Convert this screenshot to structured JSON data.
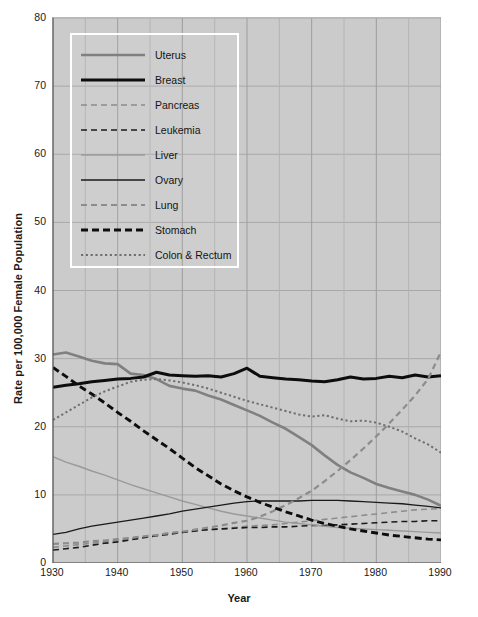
{
  "chart_data": {
    "type": "line",
    "title": "",
    "xlabel": "Year",
    "ylabel": "Rate per 100,000 Female Population",
    "xlim": [
      1930,
      1990
    ],
    "ylim": [
      0,
      80
    ],
    "ytick_labels": [
      "0",
      "10",
      "20",
      "30",
      "40",
      "50",
      "60",
      "70",
      "80"
    ],
    "ytick_values": [
      0,
      10,
      20,
      30,
      40,
      50,
      60,
      70,
      80
    ],
    "xtick_labels": [
      "1930",
      "1940",
      "1950",
      "1960",
      "1970",
      "1980",
      "1990"
    ],
    "xtick_values": [
      1930,
      1940,
      1950,
      1960,
      1970,
      1980,
      1990
    ],
    "xminor_values": [
      1935,
      1945,
      1955,
      1965,
      1975,
      1985
    ],
    "grid": true,
    "legend_position": "upper-left",
    "x": [
      1930,
      1932,
      1934,
      1936,
      1938,
      1940,
      1942,
      1944,
      1946,
      1948,
      1950,
      1952,
      1954,
      1956,
      1958,
      1960,
      1962,
      1964,
      1966,
      1968,
      1970,
      1972,
      1974,
      1976,
      1978,
      1980,
      1982,
      1984,
      1986,
      1988,
      1990
    ],
    "series": [
      {
        "name": "Uterus",
        "style": "solid",
        "color": "#808080",
        "width": 2.6,
        "values": [
          30.6,
          30.9,
          30.3,
          29.7,
          29.3,
          29.2,
          27.8,
          27.6,
          27.0,
          26.0,
          25.6,
          25.3,
          24.6,
          24.0,
          23.2,
          22.4,
          21.6,
          20.6,
          19.7,
          18.5,
          17.3,
          15.8,
          14.4,
          13.3,
          12.5,
          11.6,
          11.0,
          10.5,
          10.0,
          9.3,
          8.4
        ]
      },
      {
        "name": "Breast",
        "style": "solid",
        "color": "#0d0d0d",
        "width": 3.0,
        "values": [
          25.8,
          26.1,
          26.3,
          26.6,
          26.8,
          27.0,
          27.1,
          27.3,
          28.0,
          27.6,
          27.5,
          27.4,
          27.5,
          27.3,
          27.8,
          28.6,
          27.4,
          27.2,
          27.0,
          26.9,
          26.7,
          26.6,
          26.9,
          27.3,
          27.0,
          27.1,
          27.4,
          27.2,
          27.6,
          27.3,
          27.5
        ]
      },
      {
        "name": "Pancreas",
        "style": "dashed-light",
        "color": "#8c8c8c",
        "width": 1.6,
        "values": [
          2.3,
          2.5,
          2.7,
          2.9,
          3.1,
          3.3,
          3.6,
          3.8,
          4.1,
          4.3,
          4.5,
          4.7,
          4.9,
          5.0,
          5.2,
          5.4,
          5.5,
          5.6,
          5.8,
          6.0,
          6.2,
          6.4,
          6.6,
          6.8,
          7.0,
          7.2,
          7.4,
          7.6,
          7.8,
          7.9,
          8.0
        ]
      },
      {
        "name": "Leukemia",
        "style": "dashed-dark",
        "color": "#1a1a1a",
        "width": 1.6,
        "values": [
          1.9,
          2.1,
          2.3,
          2.6,
          2.9,
          3.1,
          3.4,
          3.7,
          4.0,
          4.2,
          4.5,
          4.7,
          4.9,
          5.0,
          5.1,
          5.2,
          5.2,
          5.3,
          5.3,
          5.4,
          5.5,
          5.5,
          5.6,
          5.7,
          5.8,
          5.9,
          6.0,
          6.1,
          6.1,
          6.2,
          6.2
        ]
      },
      {
        "name": "Liver",
        "style": "solid",
        "color": "#9a9a9a",
        "width": 1.4,
        "values": [
          15.6,
          14.8,
          14.2,
          13.5,
          12.9,
          12.2,
          11.5,
          10.9,
          10.3,
          9.7,
          9.1,
          8.6,
          8.1,
          7.6,
          7.2,
          6.9,
          6.6,
          6.3,
          6.0,
          5.8,
          5.6,
          5.4,
          5.2,
          5.1,
          5.0,
          4.9,
          4.8,
          4.7,
          4.6,
          4.5,
          4.4
        ]
      },
      {
        "name": "Ovary",
        "style": "solid",
        "color": "#1a1a1a",
        "width": 1.3,
        "values": [
          4.2,
          4.5,
          5.0,
          5.4,
          5.7,
          6.0,
          6.3,
          6.6,
          6.9,
          7.2,
          7.6,
          7.9,
          8.2,
          8.5,
          8.8,
          9.0,
          9.1,
          9.1,
          9.1,
          9.1,
          9.2,
          9.2,
          9.2,
          9.1,
          9.0,
          8.9,
          8.8,
          8.7,
          8.5,
          8.3,
          8.1
        ]
      },
      {
        "name": "Lung",
        "style": "dashed-light",
        "color": "#8c8c8c",
        "width": 2.2,
        "values": [
          2.8,
          2.9,
          3.0,
          3.2,
          3.3,
          3.5,
          3.7,
          3.9,
          4.1,
          4.4,
          4.6,
          4.9,
          5.2,
          5.5,
          5.9,
          6.2,
          6.8,
          7.6,
          8.5,
          9.5,
          10.6,
          12.0,
          13.5,
          15.1,
          16.8,
          18.6,
          20.5,
          22.5,
          24.6,
          27.0,
          31.0
        ]
      },
      {
        "name": "Stomach",
        "style": "dashed-bold",
        "color": "#0d0d0d",
        "width": 2.9,
        "values": [
          28.7,
          27.4,
          26.0,
          24.8,
          23.5,
          22.1,
          20.8,
          19.4,
          18.1,
          16.8,
          15.4,
          14.0,
          12.8,
          11.6,
          10.6,
          9.7,
          8.9,
          8.2,
          7.5,
          6.9,
          6.3,
          5.8,
          5.4,
          5.0,
          4.7,
          4.4,
          4.1,
          3.9,
          3.7,
          3.5,
          3.4
        ]
      },
      {
        "name": "Colon & Rectum",
        "style": "dotted",
        "color": "#6f6f6f",
        "width": 2.0,
        "values": [
          21.0,
          22.1,
          23.2,
          24.3,
          25.2,
          25.9,
          26.6,
          26.9,
          27.0,
          26.8,
          26.5,
          26.1,
          25.6,
          25.0,
          24.4,
          23.8,
          23.3,
          22.8,
          22.3,
          21.8,
          21.5,
          21.7,
          21.2,
          20.8,
          20.9,
          20.6,
          20.0,
          19.3,
          18.3,
          17.4,
          16.2
        ]
      }
    ]
  },
  "legend": {
    "items": [
      {
        "label": "Uterus"
      },
      {
        "label": "Breast"
      },
      {
        "label": "Pancreas"
      },
      {
        "label": "Leukemia"
      },
      {
        "label": "Liver"
      },
      {
        "label": "Ovary"
      },
      {
        "label": "Lung"
      },
      {
        "label": "Stomach"
      },
      {
        "label": "Colon & Rectum"
      }
    ]
  }
}
